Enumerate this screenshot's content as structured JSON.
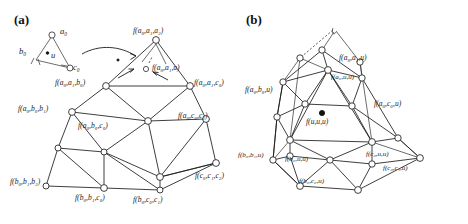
{
  "figure": {
    "panels": [
      {
        "id": "a",
        "letter": "(a)"
      },
      {
        "id": "b",
        "letter": "(b)"
      }
    ]
  },
  "panel_a": {
    "letter": "(a)",
    "inset": {
      "vertex_a": "a₀",
      "vertex_b": "b₀",
      "vertex_c": "c₀",
      "interior_point": "u"
    },
    "labels": {
      "top": "f(a₀,a₁,a₂)",
      "interior_u": "f(a₀,a₁,u)",
      "left_upper": "f(a₀,a₁,b₀)",
      "right_upper": "f(a₀,a₁,c₀)",
      "left_mid": "f(a₀,b₀,b₁)",
      "center": "f(a₀,b₀,c₀)",
      "right_mid": "f(a₀,c₀,c₁)",
      "left_bottom": "f(b₀,b₁,b₂)",
      "bottom_left": "f(b₀,b₁,c₀)",
      "bottom_center": "f(b₀,c₀,c₁)",
      "bottom_right": "f(c₀,c₁,c₂)"
    }
  },
  "panel_b": {
    "letter": "(b)",
    "labels": {
      "apex": "f(a₀,a₁,u)",
      "a_uu": "f(a₀,u,u)",
      "a_b_u": "f(a₀,b₀,u)",
      "a_c_u": "f(a₀,c₀,u)",
      "center": "f(u,u,u)",
      "b_b_u": "f(b₀,b₁,u)",
      "b_uu": "f(b₀,u,u)",
      "c_uu": "f(c₀,u,u)",
      "b_c_u": "f(b₀,c₀,u)",
      "c_c_u": "f(c₀,c₁,u)"
    }
  },
  "colors": {
    "ink": "#1c1c1c",
    "background": "#ffffff",
    "node_fill": "#ffffff",
    "marked_node_fill": "#111111"
  }
}
